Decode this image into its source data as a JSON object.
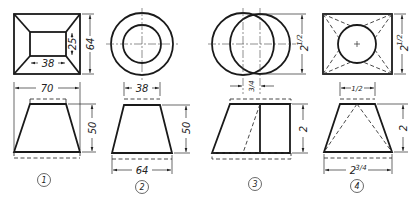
{
  "figure": {
    "parts": [
      {
        "label": "1",
        "top_view": {
          "shape": "square-frustum-top",
          "dims": {
            "outer_height": "64",
            "inner_height": "25",
            "inner_width": "38"
          }
        },
        "front_view": {
          "dims": {
            "bottom_width": "70",
            "height": "50"
          }
        }
      },
      {
        "label": "2",
        "top_view": {
          "shape": "concentric-circles",
          "dims": {
            "top_diameter": "38"
          }
        },
        "front_view": {
          "dims": {
            "height": "50",
            "bottom_width": "64"
          }
        }
      },
      {
        "label": "3",
        "top_view": {
          "shape": "offset-circles",
          "dims": {
            "diameter": "2",
            "diameter_frac": "1/2",
            "offset": "3/4"
          }
        },
        "front_view": {
          "dims": {
            "height": "2"
          }
        }
      },
      {
        "label": "4",
        "top_view": {
          "shape": "square-with-circle",
          "dims": {
            "side": "2",
            "side_frac": "1/2",
            "top_width": "1/2"
          }
        },
        "front_view": {
          "dims": {
            "height": "2",
            "bottom_width": "2",
            "bottom_width_frac": "3/4"
          }
        }
      }
    ]
  }
}
